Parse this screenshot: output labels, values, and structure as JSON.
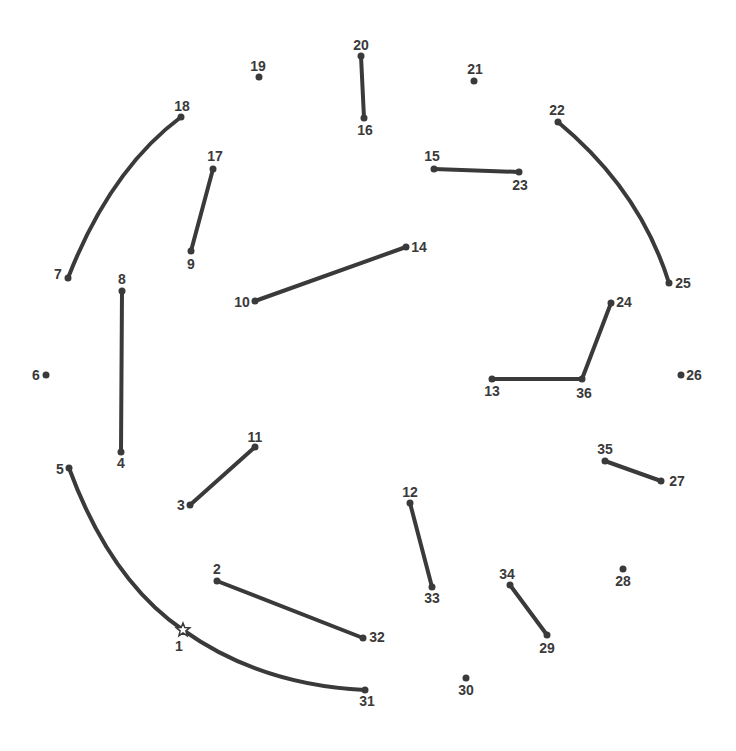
{
  "puzzle": {
    "type": "connect-the-dots",
    "line_color": "#3a3a3a",
    "points": [
      {
        "n": "1",
        "x": 183,
        "y": 630,
        "lx": 179,
        "ly": 651,
        "start": true
      },
      {
        "n": "2",
        "x": 217,
        "y": 581,
        "lx": 217,
        "ly": 574
      },
      {
        "n": "3",
        "x": 190,
        "y": 505,
        "lx": 181,
        "ly": 510
      },
      {
        "n": "4",
        "x": 121,
        "y": 452,
        "lx": 121,
        "ly": 468
      },
      {
        "n": "5",
        "x": 69,
        "y": 468,
        "lx": 60,
        "ly": 474
      },
      {
        "n": "6",
        "x": 46,
        "y": 375,
        "lx": 36,
        "ly": 380
      },
      {
        "n": "7",
        "x": 68,
        "y": 278,
        "lx": 58,
        "ly": 279
      },
      {
        "n": "8",
        "x": 122,
        "y": 291,
        "lx": 122,
        "ly": 284
      },
      {
        "n": "9",
        "x": 191,
        "y": 251,
        "lx": 191,
        "ly": 269
      },
      {
        "n": "10",
        "x": 255,
        "y": 301,
        "lx": 242,
        "ly": 307
      },
      {
        "n": "11",
        "x": 255,
        "y": 447,
        "lx": 255,
        "ly": 442
      },
      {
        "n": "12",
        "x": 410,
        "y": 503,
        "lx": 410,
        "ly": 497
      },
      {
        "n": "13",
        "x": 492,
        "y": 379,
        "lx": 492,
        "ly": 396
      },
      {
        "n": "14",
        "x": 406,
        "y": 247,
        "lx": 419,
        "ly": 252
      },
      {
        "n": "15",
        "x": 434,
        "y": 169,
        "lx": 432,
        "ly": 161
      },
      {
        "n": "16",
        "x": 364,
        "y": 118,
        "lx": 365,
        "ly": 135
      },
      {
        "n": "17",
        "x": 213,
        "y": 169,
        "lx": 215,
        "ly": 161
      },
      {
        "n": "18",
        "x": 181,
        "y": 117,
        "lx": 182,
        "ly": 111
      },
      {
        "n": "19",
        "x": 259,
        "y": 77,
        "lx": 258,
        "ly": 71
      },
      {
        "n": "20",
        "x": 361,
        "y": 56,
        "lx": 361,
        "ly": 50
      },
      {
        "n": "21",
        "x": 474,
        "y": 81,
        "lx": 475,
        "ly": 74
      },
      {
        "n": "22",
        "x": 558,
        "y": 122,
        "lx": 557,
        "ly": 115
      },
      {
        "n": "23",
        "x": 519,
        "y": 172,
        "lx": 520,
        "ly": 190
      },
      {
        "n": "24",
        "x": 611,
        "y": 303,
        "lx": 624,
        "ly": 307
      },
      {
        "n": "25",
        "x": 669,
        "y": 283,
        "lx": 683,
        "ly": 288
      },
      {
        "n": "26",
        "x": 681,
        "y": 375,
        "lx": 694,
        "ly": 380
      },
      {
        "n": "27",
        "x": 661,
        "y": 481,
        "lx": 677,
        "ly": 486
      },
      {
        "n": "28",
        "x": 623,
        "y": 569,
        "lx": 623,
        "ly": 586
      },
      {
        "n": "29",
        "x": 547,
        "y": 635,
        "lx": 547,
        "ly": 653
      },
      {
        "n": "30",
        "x": 466,
        "y": 678,
        "lx": 466,
        "ly": 695
      },
      {
        "n": "31",
        "x": 365,
        "y": 690,
        "lx": 367,
        "ly": 706
      },
      {
        "n": "32",
        "x": 363,
        "y": 638,
        "lx": 377,
        "ly": 642
      },
      {
        "n": "33",
        "x": 432,
        "y": 587,
        "lx": 432,
        "ly": 603
      },
      {
        "n": "34",
        "x": 510,
        "y": 585,
        "lx": 507,
        "ly": 579
      },
      {
        "n": "35",
        "x": 605,
        "y": 461,
        "lx": 605,
        "ly": 454
      },
      {
        "n": "36",
        "x": 582,
        "y": 379,
        "lx": 584,
        "ly": 398
      }
    ]
  }
}
